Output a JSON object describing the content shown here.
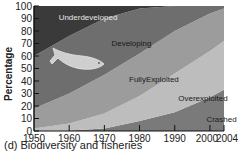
{
  "chart_data": {
    "type": "area",
    "stacked": true,
    "title": "",
    "caption": "(d) Biodiversity and fisheries",
    "xlabel": "",
    "ylabel": "Percentage",
    "x": [
      1950,
      1960,
      1970,
      1980,
      1990,
      2000,
      2004
    ],
    "xticks": [
      1950,
      1960,
      1970,
      1980,
      1990,
      2000,
      2004
    ],
    "yticks": [
      0,
      10,
      20,
      30,
      40,
      50,
      60,
      70,
      80,
      90,
      100
    ],
    "ylim": [
      0,
      100
    ],
    "xlim": [
      1950,
      2004
    ],
    "grid": false,
    "legend_position": "inline labels",
    "series": [
      {
        "name": "Crashed",
        "values": [
          0,
          0.5,
          2,
          8,
          15,
          27,
          33
        ],
        "color": "#7a7a7a"
      },
      {
        "name": "Overexploited",
        "values": [
          2,
          5.5,
          12,
          20,
          31,
          37,
          39
        ],
        "color": "#bdbdbd"
      },
      {
        "name": "FullyExploited",
        "values": [
          16,
          24,
          31,
          34,
          34,
          30,
          26
        ],
        "color": "#9c9c9c"
      },
      {
        "name": "Developing",
        "values": [
          42,
          46,
          45,
          36,
          20,
          6,
          2
        ],
        "color": "#6e6e6e"
      },
      {
        "name": "Underdeveloped",
        "values": [
          40,
          24,
          10,
          2,
          0,
          0,
          0
        ],
        "color": "#3a3a3a"
      }
    ],
    "annotations": [
      {
        "text": "Underdeveloped",
        "x": 1957,
        "y": 89
      },
      {
        "text": "Developing",
        "x": 1972,
        "y": 68
      },
      {
        "text": "FullyExploited",
        "x": 1977,
        "y": 39
      },
      {
        "text": "Overexploited",
        "x": 1991,
        "y": 24
      },
      {
        "text": "Crashed",
        "x": 1999,
        "y": 7
      }
    ],
    "decoration": "fish illustration"
  },
  "labels": {
    "ylabel": "Percentage",
    "caption": "(d) Biodiversity and fisheries"
  }
}
